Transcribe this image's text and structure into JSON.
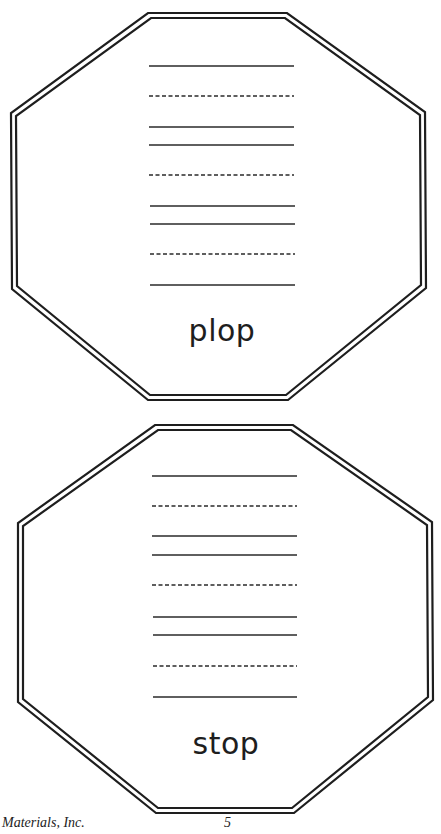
{
  "cards": [
    {
      "word": "plop",
      "shape": "octagon",
      "writing_lines": [
        "solid",
        "dashed",
        "solid",
        "solid",
        "dashed",
        "solid",
        "solid",
        "dashed",
        "solid"
      ]
    },
    {
      "word": "stop",
      "shape": "octagon",
      "writing_lines": [
        "solid",
        "dashed",
        "solid",
        "solid",
        "dashed",
        "solid",
        "solid",
        "dashed",
        "solid"
      ]
    }
  ],
  "footer": {
    "publisher": "Materials, Inc.",
    "page_number": "5"
  },
  "colors": {
    "ink": "#1e1e1e",
    "paper": "#ffffff"
  }
}
